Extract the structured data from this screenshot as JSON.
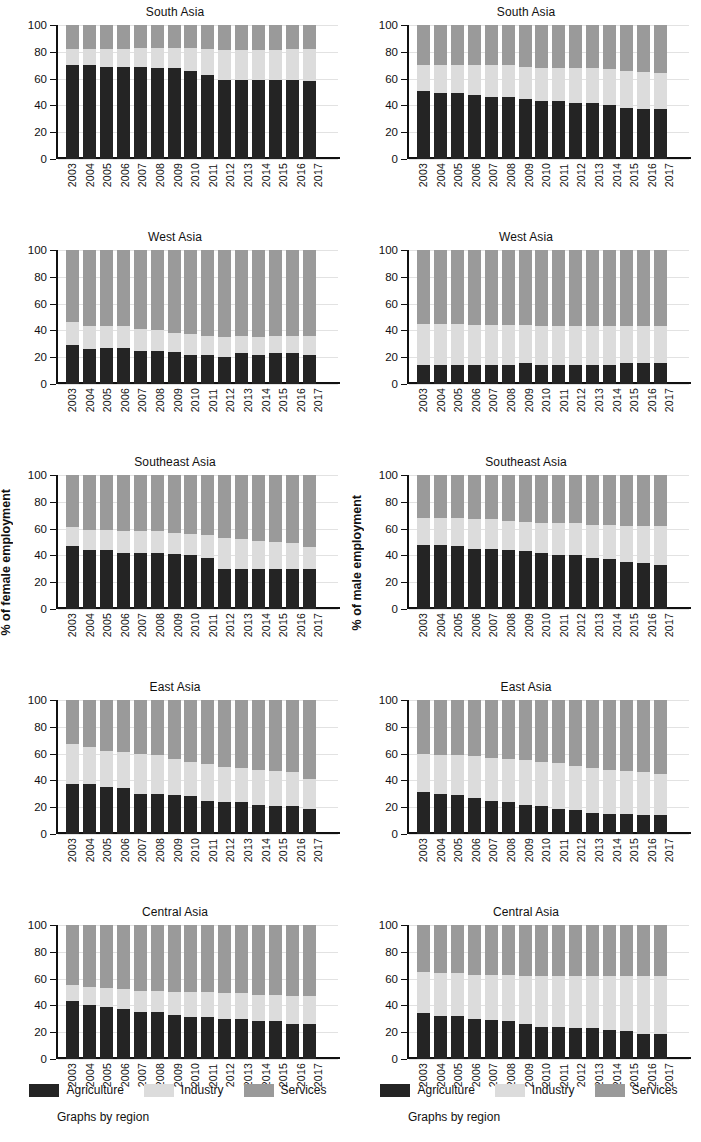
{
  "figure": {
    "left_axis_title": "% of female employment",
    "right_axis_title": "% of male employment",
    "footnote": "Graphs by region"
  },
  "legend": {
    "items": [
      {
        "label": "Agriculture",
        "color": "#242424",
        "key": "agriculture"
      },
      {
        "label": "Industry",
        "color": "#dcdcdc",
        "key": "industry"
      },
      {
        "label": "Services",
        "color": "#9a9a9a",
        "key": "services"
      }
    ]
  },
  "axis": {
    "yticks": [
      "100",
      "80",
      "60",
      "40",
      "20",
      "0"
    ],
    "years": [
      "2003",
      "2004",
      "2005",
      "2006",
      "2007",
      "2008",
      "2009",
      "2010",
      "2011",
      "2012",
      "2013",
      "2014",
      "2015",
      "2016",
      "2017"
    ]
  },
  "chart_data": [
    {
      "id": "south-asia-female",
      "type": "bar",
      "stacked": true,
      "title": "South Asia",
      "panel": "female",
      "xlabel": "",
      "ylabel": "% of female employment",
      "ylim": [
        0,
        100
      ],
      "grid": true,
      "legend_position": "bottom",
      "x": [
        "2003",
        "2004",
        "2005",
        "2006",
        "2007",
        "2008",
        "2009",
        "2010",
        "2011",
        "2012",
        "2013",
        "2014",
        "2015",
        "2016",
        "2017"
      ],
      "series": [
        {
          "name": "Agriculture",
          "values": [
            70,
            70,
            69,
            69,
            69,
            68,
            68,
            66,
            63,
            59,
            59,
            59,
            59,
            59,
            58
          ]
        },
        {
          "name": "Industry",
          "values": [
            12,
            12,
            13,
            13,
            14,
            15,
            15,
            17,
            19,
            22,
            22,
            22,
            22,
            23,
            24
          ]
        },
        {
          "name": "Services",
          "values": [
            18,
            18,
            18,
            18,
            17,
            17,
            17,
            17,
            18,
            19,
            19,
            19,
            19,
            18,
            18
          ]
        }
      ]
    },
    {
      "id": "south-asia-male",
      "type": "bar",
      "stacked": true,
      "title": "South Asia",
      "panel": "male",
      "xlabel": "",
      "ylabel": "% of male employment",
      "ylim": [
        0,
        100
      ],
      "grid": true,
      "legend_position": "bottom",
      "x": [
        "2003",
        "2004",
        "2005",
        "2006",
        "2007",
        "2008",
        "2009",
        "2010",
        "2011",
        "2012",
        "2013",
        "2014",
        "2015",
        "2016",
        "2017"
      ],
      "series": [
        {
          "name": "Agriculture",
          "values": [
            51,
            49,
            49,
            48,
            46,
            46,
            45,
            43,
            43,
            42,
            42,
            40,
            38,
            37,
            37
          ]
        },
        {
          "name": "Industry",
          "values": [
            19,
            21,
            21,
            22,
            24,
            24,
            24,
            25,
            25,
            26,
            26,
            27,
            28,
            28,
            27
          ]
        },
        {
          "name": "Services",
          "values": [
            30,
            30,
            30,
            30,
            30,
            30,
            31,
            32,
            32,
            32,
            32,
            33,
            34,
            35,
            36
          ]
        }
      ]
    },
    {
      "id": "west-asia-female",
      "type": "bar",
      "stacked": true,
      "title": "West Asia",
      "panel": "female",
      "xlabel": "",
      "ylabel": "% of female employment",
      "ylim": [
        0,
        100
      ],
      "grid": true,
      "legend_position": "bottom",
      "x": [
        "2003",
        "2004",
        "2005",
        "2006",
        "2007",
        "2008",
        "2009",
        "2010",
        "2011",
        "2012",
        "2013",
        "2014",
        "2015",
        "2016",
        "2017"
      ],
      "series": [
        {
          "name": "Agriculture",
          "values": [
            29,
            26,
            27,
            27,
            25,
            25,
            24,
            22,
            22,
            20,
            23,
            22,
            23,
            23,
            22
          ]
        },
        {
          "name": "Industry",
          "values": [
            17,
            17,
            16,
            16,
            16,
            15,
            14,
            15,
            14,
            15,
            13,
            13,
            13,
            13,
            14
          ]
        },
        {
          "name": "Services",
          "values": [
            54,
            57,
            57,
            57,
            59,
            60,
            62,
            63,
            64,
            65,
            64,
            65,
            64,
            64,
            64
          ]
        }
      ]
    },
    {
      "id": "west-asia-male",
      "type": "bar",
      "stacked": true,
      "title": "West Asia",
      "panel": "male",
      "xlabel": "",
      "ylabel": "% of male employment",
      "ylim": [
        0,
        100
      ],
      "grid": true,
      "legend_position": "bottom",
      "x": [
        "2003",
        "2004",
        "2005",
        "2006",
        "2007",
        "2008",
        "2009",
        "2010",
        "2011",
        "2012",
        "2013",
        "2014",
        "2015",
        "2016",
        "2017"
      ],
      "series": [
        {
          "name": "Agriculture",
          "values": [
            14,
            14,
            14,
            14,
            14,
            14,
            16,
            14,
            14,
            14,
            14,
            14,
            16,
            16,
            16
          ]
        },
        {
          "name": "Industry",
          "values": [
            31,
            31,
            31,
            30,
            30,
            30,
            28,
            29,
            29,
            29,
            29,
            29,
            27,
            27,
            27
          ]
        },
        {
          "name": "Services",
          "values": [
            55,
            55,
            55,
            56,
            56,
            56,
            56,
            57,
            57,
            57,
            57,
            57,
            57,
            57,
            57
          ]
        }
      ]
    },
    {
      "id": "southeast-asia-female",
      "type": "bar",
      "stacked": true,
      "title": "Southeast Asia",
      "panel": "female",
      "xlabel": "",
      "ylabel": "% of female employment",
      "ylim": [
        0,
        100
      ],
      "grid": true,
      "legend_position": "bottom",
      "x": [
        "2003",
        "2004",
        "2005",
        "2006",
        "2007",
        "2008",
        "2009",
        "2010",
        "2011",
        "2012",
        "2013",
        "2014",
        "2015",
        "2016",
        "2017"
      ],
      "series": [
        {
          "name": "Agriculture",
          "values": [
            47,
            44,
            44,
            42,
            42,
            42,
            41,
            40,
            38,
            30,
            30,
            30,
            30,
            30,
            30
          ]
        },
        {
          "name": "Industry",
          "values": [
            14,
            15,
            15,
            16,
            16,
            16,
            16,
            16,
            17,
            23,
            22,
            21,
            20,
            19,
            16
          ]
        },
        {
          "name": "Services",
          "values": [
            39,
            41,
            41,
            42,
            42,
            42,
            43,
            44,
            45,
            47,
            48,
            49,
            50,
            51,
            54
          ]
        }
      ]
    },
    {
      "id": "southeast-asia-male",
      "type": "bar",
      "stacked": true,
      "title": "Southeast Asia",
      "panel": "male",
      "xlabel": "",
      "ylabel": "% of male employment",
      "ylim": [
        0,
        100
      ],
      "grid": true,
      "legend_position": "bottom",
      "x": [
        "2003",
        "2004",
        "2005",
        "2006",
        "2007",
        "2008",
        "2009",
        "2010",
        "2011",
        "2012",
        "2013",
        "2014",
        "2015",
        "2016",
        "2017"
      ],
      "series": [
        {
          "name": "Agriculture",
          "values": [
            48,
            48,
            47,
            45,
            45,
            44,
            43,
            42,
            40,
            40,
            38,
            37,
            35,
            34,
            33
          ]
        },
        {
          "name": "Industry",
          "values": [
            20,
            20,
            21,
            22,
            22,
            22,
            22,
            22,
            24,
            24,
            25,
            26,
            27,
            28,
            29
          ]
        },
        {
          "name": "Services",
          "values": [
            32,
            32,
            32,
            33,
            33,
            34,
            35,
            36,
            36,
            36,
            37,
            37,
            38,
            38,
            38
          ]
        }
      ]
    },
    {
      "id": "east-asia-female",
      "type": "bar",
      "stacked": true,
      "title": "East Asia",
      "panel": "female",
      "xlabel": "",
      "ylabel": "% of female employment",
      "ylim": [
        0,
        100
      ],
      "grid": true,
      "legend_position": "bottom",
      "x": [
        "2003",
        "2004",
        "2005",
        "2006",
        "2007",
        "2008",
        "2009",
        "2010",
        "2011",
        "2012",
        "2013",
        "2014",
        "2015",
        "2016",
        "2017"
      ],
      "series": [
        {
          "name": "Agriculture",
          "values": [
            37,
            37,
            35,
            34,
            30,
            30,
            29,
            28,
            25,
            24,
            24,
            22,
            21,
            21,
            19
          ]
        },
        {
          "name": "Industry",
          "values": [
            30,
            28,
            27,
            27,
            30,
            29,
            27,
            26,
            27,
            26,
            25,
            26,
            26,
            25,
            22
          ]
        },
        {
          "name": "Services",
          "values": [
            33,
            35,
            38,
            39,
            40,
            41,
            44,
            46,
            48,
            50,
            51,
            52,
            53,
            54,
            59
          ]
        }
      ]
    },
    {
      "id": "east-asia-male",
      "type": "bar",
      "stacked": true,
      "title": "East Asia",
      "panel": "male",
      "xlabel": "",
      "ylabel": "% of male employment",
      "ylim": [
        0,
        100
      ],
      "grid": true,
      "legend_position": "bottom",
      "x": [
        "2003",
        "2004",
        "2005",
        "2006",
        "2007",
        "2008",
        "2009",
        "2010",
        "2011",
        "2012",
        "2013",
        "2014",
        "2015",
        "2016",
        "2017"
      ],
      "series": [
        {
          "name": "Agriculture",
          "values": [
            31,
            30,
            29,
            27,
            25,
            24,
            22,
            21,
            19,
            18,
            16,
            15,
            15,
            14,
            14
          ]
        },
        {
          "name": "Industry",
          "values": [
            29,
            29,
            30,
            31,
            32,
            32,
            33,
            33,
            34,
            33,
            33,
            33,
            32,
            32,
            31
          ]
        },
        {
          "name": "Services",
          "values": [
            40,
            41,
            41,
            42,
            43,
            44,
            45,
            46,
            47,
            49,
            51,
            52,
            53,
            54,
            55
          ]
        }
      ]
    },
    {
      "id": "central-asia-female",
      "type": "bar",
      "stacked": true,
      "title": "Central Asia",
      "panel": "female",
      "xlabel": "",
      "ylabel": "% of female employment",
      "ylim": [
        0,
        100
      ],
      "grid": true,
      "legend_position": "bottom",
      "x": [
        "2003",
        "2004",
        "2005",
        "2006",
        "2007",
        "2008",
        "2009",
        "2010",
        "2011",
        "2012",
        "2013",
        "2014",
        "2015",
        "2016",
        "2017"
      ],
      "series": [
        {
          "name": "Agriculture",
          "values": [
            43,
            40,
            39,
            37,
            35,
            35,
            33,
            31,
            31,
            30,
            30,
            28,
            28,
            26,
            26
          ]
        },
        {
          "name": "Industry",
          "values": [
            12,
            14,
            14,
            15,
            16,
            16,
            17,
            19,
            19,
            19,
            19,
            20,
            20,
            21,
            21
          ]
        },
        {
          "name": "Services",
          "values": [
            45,
            46,
            47,
            48,
            49,
            49,
            50,
            50,
            50,
            51,
            51,
            52,
            52,
            53,
            53
          ]
        }
      ]
    },
    {
      "id": "central-asia-male",
      "type": "bar",
      "stacked": true,
      "title": "Central Asia",
      "panel": "male",
      "xlabel": "",
      "ylabel": "% of male employment",
      "ylim": [
        0,
        100
      ],
      "grid": true,
      "legend_position": "bottom",
      "x": [
        "2003",
        "2004",
        "2005",
        "2006",
        "2007",
        "2008",
        "2009",
        "2010",
        "2011",
        "2012",
        "2013",
        "2014",
        "2015",
        "2016",
        "2017"
      ],
      "series": [
        {
          "name": "Agriculture",
          "values": [
            34,
            32,
            32,
            30,
            29,
            28,
            26,
            24,
            24,
            23,
            23,
            22,
            21,
            19,
            19
          ]
        },
        {
          "name": "Industry",
          "values": [
            31,
            32,
            32,
            33,
            34,
            35,
            36,
            38,
            38,
            39,
            39,
            40,
            41,
            43,
            43
          ]
        },
        {
          "name": "Services",
          "values": [
            35,
            36,
            36,
            37,
            37,
            37,
            38,
            38,
            38,
            38,
            38,
            38,
            38,
            38,
            38
          ]
        }
      ]
    }
  ]
}
